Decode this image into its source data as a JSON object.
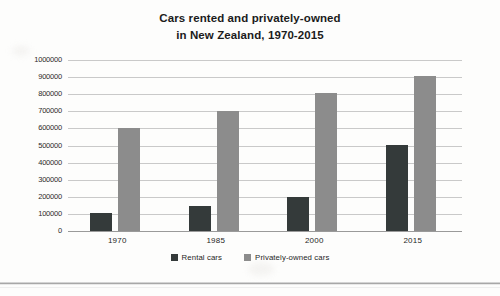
{
  "chart_data": {
    "type": "bar",
    "title": "Cars rented and privately-owned in New Zealand, 1970-2015",
    "title_lines": [
      "Cars rented and privately-owned",
      "in New Zealand, 1970-2015"
    ],
    "categories": [
      "1970",
      "1985",
      "2000",
      "2015"
    ],
    "series": [
      {
        "name": "Rental cars",
        "color": "#343a3a",
        "values": [
          105000,
          145000,
          200000,
          505000
        ]
      },
      {
        "name": "Privately-owned cars",
        "color": "#8c8c8c",
        "values": [
          605000,
          700000,
          805000,
          905000
        ]
      }
    ],
    "xlabel": "",
    "ylabel": "",
    "ylim": [
      0,
      1000000
    ],
    "ytick_step": 100000,
    "yticks": [
      "1000000",
      "900000",
      "800000",
      "700000",
      "600000",
      "500000",
      "400000",
      "300000",
      "200000",
      "100000",
      "0"
    ],
    "ytick_values": [
      1000000,
      900000,
      800000,
      700000,
      600000,
      500000,
      400000,
      300000,
      200000,
      100000,
      0
    ],
    "grid": true,
    "legend_position": "bottom"
  },
  "legend": {
    "items": [
      {
        "label": "Rental cars",
        "color": "#343a3a"
      },
      {
        "label": "Privately-owned cars",
        "color": "#8c8c8c"
      }
    ]
  }
}
